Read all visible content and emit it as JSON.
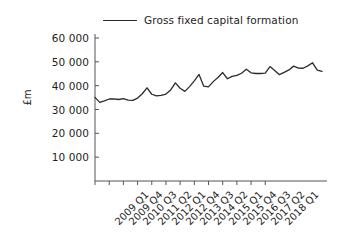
{
  "chart_data": {
    "type": "line",
    "title": "",
    "subtitle": "",
    "xlabel": "",
    "ylabel": "£m",
    "ylim": [
      0,
      60000
    ],
    "xlim_labels": [
      "2009 Q1",
      "2018 Q1"
    ],
    "grid": false,
    "legend_position": "top-center",
    "legend": [
      "Gross fixed capital formation"
    ],
    "series": [
      {
        "name": "Gross fixed capital formation",
        "color": "#2b2b2b",
        "values": [
          35100,
          33000,
          33600,
          34400,
          34500,
          34200,
          34600,
          33900,
          33800,
          34800,
          36600,
          39100,
          36400,
          35700,
          35900,
          36500,
          38200,
          41200,
          38900,
          37600,
          39600,
          42000,
          44700,
          39800,
          39500,
          41700,
          43400,
          45500,
          42900,
          43900,
          44300,
          45200,
          46900,
          45400,
          45100,
          45100,
          45300,
          48000,
          46400,
          44600,
          45600,
          46600,
          48200,
          47400,
          47300,
          48300,
          49600,
          46500,
          46000
        ]
      }
    ],
    "x_categories": [
      "2009 Q1",
      "2009 Q2",
      "2009 Q3",
      "2009 Q4",
      "2010 Q1",
      "2010 Q2",
      "2010 Q3",
      "2010 Q4",
      "2011 Q1",
      "2011 Q2",
      "2011 Q3",
      "2011 Q4",
      "2012 Q1",
      "2012 Q2",
      "2012 Q3",
      "2012 Q4",
      "2013 Q1",
      "2013 Q2",
      "2013 Q3",
      "2013 Q4",
      "2014 Q1",
      "2014 Q2",
      "2014 Q3",
      "2014 Q4",
      "2015 Q1",
      "2015 Q2",
      "2015 Q3",
      "2015 Q4",
      "2016 Q1",
      "2016 Q2",
      "2016 Q3",
      "2016 Q4",
      "2017 Q1",
      "2017 Q2",
      "2017 Q3",
      "2017 Q4",
      "2018 Q1",
      "2018 Q2",
      "2018 Q3",
      "2018 Q4",
      "2019 Q1",
      "2019 Q2",
      "2019 Q3",
      "2019 Q4",
      "2020 Q1",
      "2020 Q2",
      "2020 Q3",
      "2020 Q4",
      "2021 Q1"
    ],
    "x_tick_labels": [
      "2009 Q1",
      "2009 Q4",
      "2010 Q3",
      "2011 Q2",
      "2012 Q1",
      "2012 Q4",
      "2013 Q3",
      "2014 Q2",
      "2015 Q1",
      "2015 Q4",
      "2016 Q3",
      "2017 Q2",
      "2018 Q1"
    ],
    "y_tick_labels": [
      "10 000",
      "20 000",
      "30 000",
      "40 000",
      "50 000",
      "60 000"
    ],
    "y_tick_values": [
      10000,
      20000,
      30000,
      40000,
      50000,
      60000
    ],
    "axis_color": "#555555",
    "background_color": "#ffffff"
  }
}
